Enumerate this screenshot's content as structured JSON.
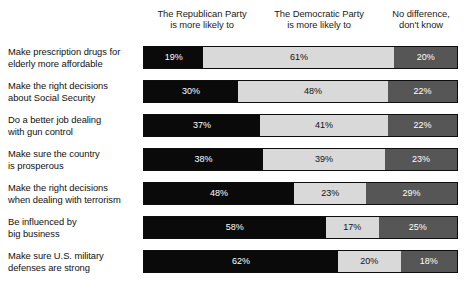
{
  "chart_data": {
    "type": "bar",
    "title": "",
    "subtitle": "",
    "xlabel": "",
    "ylabel": "",
    "orientation": "horizontal",
    "stacked": true,
    "normalized": true,
    "grid": false,
    "xlim": [
      0,
      100
    ],
    "value_suffix": "%",
    "legend_position": "top",
    "legend": [
      "The Republican Party\nis more likely to",
      "The Democratic Party\nis more likely to",
      "No difference,\ndon't know"
    ],
    "series_colors": [
      "#0a0a0a",
      "#d9d9d9",
      "#565656"
    ],
    "categories": [
      "Make prescription drugs for\nelderly more affordable",
      "Make the right decisions\nabout Social Security",
      "Do a better job dealing\nwith gun control",
      "Make sure the country\nis prosperous",
      "Make the right decisions\nwhen dealing with terrorism",
      "Be influenced by\nbig business",
      "Make sure U.S. military\ndefenses are strong"
    ],
    "series": [
      {
        "name": "The Republican Party is more likely to",
        "color": "#0a0a0a",
        "values": [
          19,
          30,
          37,
          38,
          48,
          58,
          62
        ],
        "labels": [
          "19%",
          "30%",
          "37%",
          "38%",
          "48%",
          "58%",
          "62%"
        ]
      },
      {
        "name": "The Democratic Party is more likely to",
        "color": "#d9d9d9",
        "values": [
          61,
          48,
          41,
          39,
          23,
          17,
          20
        ],
        "labels": [
          "61%",
          "48%",
          "41%",
          "39%",
          "23%",
          "17%",
          "20%"
        ]
      },
      {
        "name": "No difference, don't know",
        "color": "#565656",
        "values": [
          20,
          22,
          22,
          23,
          29,
          25,
          18
        ],
        "labels": [
          "20%",
          "22%",
          "22%",
          "23%",
          "29%",
          "25%",
          "18%"
        ]
      }
    ]
  }
}
